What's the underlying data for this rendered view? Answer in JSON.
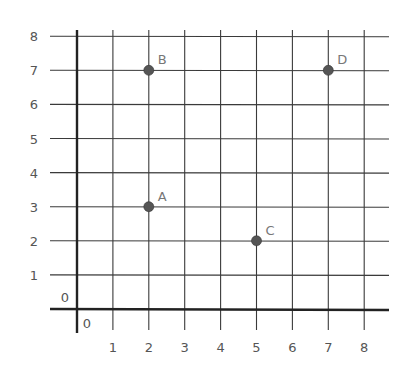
{
  "chart_data": {
    "type": "scatter",
    "title": "",
    "xlabel": "",
    "ylabel": "",
    "xlim": [
      0,
      8
    ],
    "ylim": [
      0,
      8
    ],
    "grid": true,
    "legend": null,
    "x_ticks": [
      "1",
      "2",
      "3",
      "4",
      "5",
      "6",
      "7",
      "8"
    ],
    "y_ticks": [
      "1",
      "2",
      "3",
      "4",
      "5",
      "6",
      "7",
      "8"
    ],
    "origin_labels": {
      "x": "0",
      "y": "0"
    },
    "points": [
      {
        "label": "A",
        "x": 2,
        "y": 3
      },
      {
        "label": "B",
        "x": 2,
        "y": 7
      },
      {
        "label": "C",
        "x": 5,
        "y": 2
      },
      {
        "label": "D",
        "x": 7,
        "y": 7
      }
    ]
  },
  "colors": {
    "grid": "#3a3a3a",
    "axis": "#222222",
    "point": "#555555",
    "point_label": "#777777",
    "tick_label": "#555555"
  }
}
